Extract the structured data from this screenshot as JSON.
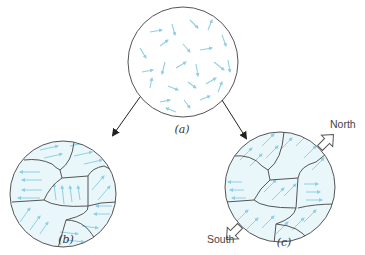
{
  "figure": {
    "panels": [
      {
        "id": "a",
        "label": "(a)",
        "description": "Random (unaligned) magnetic moments in a material without domains"
      },
      {
        "id": "b",
        "label": "(b)",
        "description": "Domains with moments aligned within each domain, domains randomly oriented"
      },
      {
        "id": "c",
        "label": "(c)",
        "description": "Domains aligned in an external field; net magnetization North-South"
      }
    ],
    "pole_labels": {
      "north": "North",
      "south": "South"
    }
  },
  "colors": {
    "arrow_fill": "#7fcbe0",
    "domain_fill": "#e6f5fa",
    "outline": "#555555",
    "connector": "#222222"
  }
}
